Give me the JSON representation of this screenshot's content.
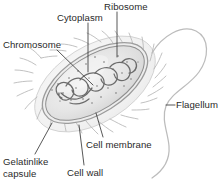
{
  "figure": {
    "background_color": "#ffffff",
    "label_color": "#2a2a2a",
    "leader_line_color": "#3a3a3a",
    "width": 222,
    "height": 187
  },
  "labels": {
    "ribosome": "Ribosome",
    "cytoplasm": "Cytoplasm",
    "chromosome": "Chromosome",
    "flagellum": "Flagellum",
    "cell_membrane": "Cell membrane",
    "gelatinlike_capsule": "Gelatinlike\ncapsule",
    "gelatinlike_capsule_line1": "Gelatinlike",
    "gelatinlike_capsule_line2": "capsule",
    "cell_wall": "Cell wall"
  },
  "caption": {
    "cropped_text": "Figure text cut off at bottom edge"
  },
  "cell": {
    "body_fill": "#e3e3e3",
    "capsule_fill": "#f2f2f2",
    "outline_color": "#8a8a8a",
    "chromosome_color": "#6e6e6e",
    "ribosome_dot_color": "#9a9a9a",
    "flagellum_color": "#b4b4b4",
    "pili_color": "#b0b0b0"
  }
}
